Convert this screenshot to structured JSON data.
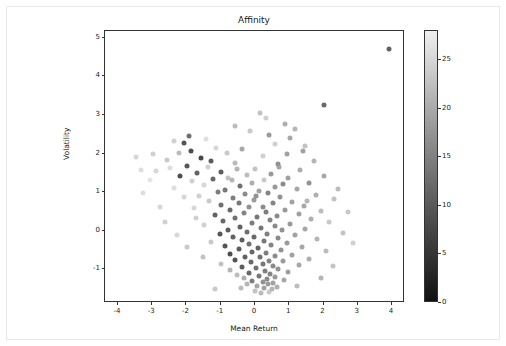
{
  "chart_data": {
    "type": "scatter",
    "title": "Affinity",
    "xlabel": "Mean Return",
    "ylabel": "Volatility",
    "xlim": [
      -4.35,
      4.35
    ],
    "ylim": [
      -1.85,
      5.15
    ],
    "xticks": [
      -4,
      -3,
      -2,
      -1,
      0,
      1,
      2,
      3,
      4
    ],
    "yticks": [
      -1,
      0,
      1,
      2,
      3,
      4,
      5
    ],
    "xtick_labels": [
      "-4",
      "-3",
      "-2",
      "-1",
      "0",
      "1",
      "2",
      "3",
      "4"
    ],
    "ytick_labels": [
      "-1",
      "0",
      "1",
      "2",
      "3",
      "4",
      "5"
    ],
    "grid": false,
    "legend": "none",
    "colorbar": {
      "label": "",
      "vmin": 0,
      "vmax": 28,
      "ticks": [
        0,
        5,
        10,
        15,
        20,
        25
      ],
      "tick_labels": [
        "0",
        "5",
        "10",
        "15",
        "20",
        "25"
      ],
      "colormap": "greys-reversed",
      "position": "right"
    },
    "marker": {
      "shape": "circle",
      "size": 5,
      "alpha": 0.85
    },
    "points": [
      {
        "x": 3.95,
        "y": 4.68,
        "c": 22
      },
      {
        "x": 2.05,
        "y": 3.22,
        "c": 21
      },
      {
        "x": 0.18,
        "y": 3.02,
        "c": 8
      },
      {
        "x": 1.2,
        "y": 2.62,
        "c": 10
      },
      {
        "x": -0.12,
        "y": 2.55,
        "c": 7
      },
      {
        "x": 0.45,
        "y": 2.45,
        "c": 14
      },
      {
        "x": 1.05,
        "y": 2.38,
        "c": 12
      },
      {
        "x": -2.35,
        "y": 2.3,
        "c": 6
      },
      {
        "x": -2.05,
        "y": 2.25,
        "c": 24
      },
      {
        "x": 0.6,
        "y": 2.22,
        "c": 6
      },
      {
        "x": 1.5,
        "y": 2.18,
        "c": 8
      },
      {
        "x": -1.1,
        "y": 2.12,
        "c": 5
      },
      {
        "x": -0.35,
        "y": 2.1,
        "c": 12
      },
      {
        "x": -1.85,
        "y": 2.05,
        "c": 25
      },
      {
        "x": -2.2,
        "y": 2.0,
        "c": 9
      },
      {
        "x": -0.8,
        "y": 1.98,
        "c": 7
      },
      {
        "x": 0.95,
        "y": 1.95,
        "c": 13
      },
      {
        "x": 0.25,
        "y": 1.9,
        "c": 6
      },
      {
        "x": -3.45,
        "y": 1.88,
        "c": 5
      },
      {
        "x": -1.55,
        "y": 1.85,
        "c": 26
      },
      {
        "x": -2.55,
        "y": 1.8,
        "c": 7
      },
      {
        "x": 1.75,
        "y": 1.78,
        "c": 10
      },
      {
        "x": -0.55,
        "y": 1.72,
        "c": 9
      },
      {
        "x": 0.7,
        "y": 1.7,
        "c": 15
      },
      {
        "x": -1.95,
        "y": 1.66,
        "c": 24
      },
      {
        "x": -1.35,
        "y": 1.62,
        "c": 6
      },
      {
        "x": -2.45,
        "y": 1.6,
        "c": 4
      },
      {
        "x": 0.02,
        "y": 1.58,
        "c": 8
      },
      {
        "x": 1.35,
        "y": 1.55,
        "c": 11
      },
      {
        "x": -2.85,
        "y": 1.52,
        "c": 5
      },
      {
        "x": -0.95,
        "y": 1.5,
        "c": 23
      },
      {
        "x": -1.65,
        "y": 1.48,
        "c": 22
      },
      {
        "x": 0.5,
        "y": 1.45,
        "c": 14
      },
      {
        "x": -0.2,
        "y": 1.42,
        "c": 9
      },
      {
        "x": 2.05,
        "y": 1.4,
        "c": 12
      },
      {
        "x": -2.15,
        "y": 1.38,
        "c": 25
      },
      {
        "x": 1.0,
        "y": 1.35,
        "c": 13
      },
      {
        "x": -1.2,
        "y": 1.32,
        "c": 21
      },
      {
        "x": 0.3,
        "y": 1.3,
        "c": 7
      },
      {
        "x": -0.65,
        "y": 1.28,
        "c": 10
      },
      {
        "x": -1.8,
        "y": 1.25,
        "c": 6
      },
      {
        "x": 1.6,
        "y": 1.22,
        "c": 15
      },
      {
        "x": -0.05,
        "y": 1.2,
        "c": 11
      },
      {
        "x": 0.85,
        "y": 1.18,
        "c": 16
      },
      {
        "x": -1.45,
        "y": 1.15,
        "c": 5
      },
      {
        "x": -0.4,
        "y": 1.12,
        "c": 20
      },
      {
        "x": 0.62,
        "y": 1.1,
        "c": 14
      },
      {
        "x": -2.35,
        "y": 1.08,
        "c": 4
      },
      {
        "x": 1.25,
        "y": 1.05,
        "c": 12
      },
      {
        "x": -0.85,
        "y": 1.02,
        "c": 19
      },
      {
        "x": 0.15,
        "y": 1.0,
        "c": 13
      },
      {
        "x": -1.05,
        "y": 0.98,
        "c": 18
      },
      {
        "x": 0.42,
        "y": 0.95,
        "c": 17
      },
      {
        "x": -0.25,
        "y": 0.92,
        "c": 16
      },
      {
        "x": 1.8,
        "y": 0.9,
        "c": 11
      },
      {
        "x": -1.6,
        "y": 0.88,
        "c": 6
      },
      {
        "x": 0.75,
        "y": 0.85,
        "c": 15
      },
      {
        "x": -0.6,
        "y": 0.82,
        "c": 18
      },
      {
        "x": 2.35,
        "y": 0.8,
        "c": 8
      },
      {
        "x": 0.0,
        "y": 0.78,
        "c": 14
      },
      {
        "x": -1.3,
        "y": 0.75,
        "c": 7
      },
      {
        "x": 1.1,
        "y": 0.72,
        "c": 13
      },
      {
        "x": -0.45,
        "y": 0.7,
        "c": 19
      },
      {
        "x": 0.55,
        "y": 0.68,
        "c": 17
      },
      {
        "x": -0.95,
        "y": 0.65,
        "c": 20
      },
      {
        "x": 1.45,
        "y": 0.62,
        "c": 12
      },
      {
        "x": 0.25,
        "y": 0.6,
        "c": 16
      },
      {
        "x": -0.15,
        "y": 0.58,
        "c": 15
      },
      {
        "x": -1.75,
        "y": 0.55,
        "c": 5
      },
      {
        "x": 0.9,
        "y": 0.52,
        "c": 14
      },
      {
        "x": -0.7,
        "y": 0.5,
        "c": 21
      },
      {
        "x": 1.95,
        "y": 0.48,
        "c": 9
      },
      {
        "x": 0.35,
        "y": 0.45,
        "c": 18
      },
      {
        "x": -0.3,
        "y": 0.42,
        "c": 17
      },
      {
        "x": 1.3,
        "y": 0.4,
        "c": 13
      },
      {
        "x": -1.15,
        "y": 0.38,
        "c": 22
      },
      {
        "x": 0.68,
        "y": 0.35,
        "c": 16
      },
      {
        "x": 0.08,
        "y": 0.32,
        "c": 19
      },
      {
        "x": -0.55,
        "y": 0.3,
        "c": 20
      },
      {
        "x": 1.65,
        "y": 0.28,
        "c": 11
      },
      {
        "x": 0.48,
        "y": 0.25,
        "c": 17
      },
      {
        "x": -0.9,
        "y": 0.22,
        "c": 21
      },
      {
        "x": 2.2,
        "y": 0.2,
        "c": 7
      },
      {
        "x": -0.05,
        "y": 0.18,
        "c": 18
      },
      {
        "x": 1.05,
        "y": 0.15,
        "c": 14
      },
      {
        "x": -1.45,
        "y": 0.12,
        "c": 6
      },
      {
        "x": 0.6,
        "y": 0.1,
        "c": 16
      },
      {
        "x": -0.4,
        "y": 0.08,
        "c": 22
      },
      {
        "x": 0.2,
        "y": 0.05,
        "c": 19
      },
      {
        "x": 1.5,
        "y": 0.02,
        "c": 12
      },
      {
        "x": -0.75,
        "y": 0.0,
        "c": 23
      },
      {
        "x": 0.82,
        "y": -0.02,
        "c": 15
      },
      {
        "x": -0.2,
        "y": -0.05,
        "c": 20
      },
      {
        "x": 2.6,
        "y": -0.08,
        "c": 8
      },
      {
        "x": 0.38,
        "y": -0.1,
        "c": 18
      },
      {
        "x": -1.0,
        "y": -0.12,
        "c": 24
      },
      {
        "x": 1.2,
        "y": -0.15,
        "c": 13
      },
      {
        "x": 0.0,
        "y": -0.18,
        "c": 21
      },
      {
        "x": -0.6,
        "y": -0.2,
        "c": 22
      },
      {
        "x": 0.7,
        "y": -0.22,
        "c": 16
      },
      {
        "x": 1.85,
        "y": -0.25,
        "c": 10
      },
      {
        "x": -0.35,
        "y": -0.28,
        "c": 23
      },
      {
        "x": 0.28,
        "y": -0.3,
        "c": 19
      },
      {
        "x": -1.25,
        "y": -0.32,
        "c": 7
      },
      {
        "x": 0.95,
        "y": -0.35,
        "c": 14
      },
      {
        "x": -0.15,
        "y": -0.38,
        "c": 20
      },
      {
        "x": 0.5,
        "y": -0.4,
        "c": 17
      },
      {
        "x": -0.85,
        "y": -0.42,
        "c": 24
      },
      {
        "x": 1.4,
        "y": -0.45,
        "c": 12
      },
      {
        "x": 0.12,
        "y": -0.48,
        "c": 22
      },
      {
        "x": -0.45,
        "y": -0.5,
        "c": 23
      },
      {
        "x": 0.78,
        "y": -0.52,
        "c": 15
      },
      {
        "x": 2.1,
        "y": -0.55,
        "c": 9
      },
      {
        "x": -0.05,
        "y": -0.58,
        "c": 21
      },
      {
        "x": 0.35,
        "y": -0.6,
        "c": 18
      },
      {
        "x": -0.7,
        "y": -0.62,
        "c": 25
      },
      {
        "x": 1.1,
        "y": -0.65,
        "c": 13
      },
      {
        "x": 0.6,
        "y": -0.68,
        "c": 16
      },
      {
        "x": -0.25,
        "y": -0.7,
        "c": 22
      },
      {
        "x": 0.18,
        "y": -0.72,
        "c": 20
      },
      {
        "x": 1.6,
        "y": -0.75,
        "c": 11
      },
      {
        "x": -0.55,
        "y": -0.78,
        "c": 24
      },
      {
        "x": 0.45,
        "y": -0.8,
        "c": 17
      },
      {
        "x": 0.85,
        "y": -0.82,
        "c": 14
      },
      {
        "x": -0.1,
        "y": -0.85,
        "c": 21
      },
      {
        "x": 0.25,
        "y": -0.88,
        "c": 19
      },
      {
        "x": -0.95,
        "y": -0.9,
        "c": 8
      },
      {
        "x": 1.3,
        "y": -0.92,
        "c": 12
      },
      {
        "x": 0.55,
        "y": -0.95,
        "c": 16
      },
      {
        "x": -0.35,
        "y": -0.98,
        "c": 23
      },
      {
        "x": 0.05,
        "y": -1.0,
        "c": 20
      },
      {
        "x": 0.7,
        "y": -1.02,
        "c": 15
      },
      {
        "x": -0.7,
        "y": -1.05,
        "c": 10
      },
      {
        "x": 0.32,
        "y": -1.08,
        "c": 18
      },
      {
        "x": 1.0,
        "y": -1.1,
        "c": 13
      },
      {
        "x": -0.15,
        "y": -1.12,
        "c": 21
      },
      {
        "x": 0.48,
        "y": -1.15,
        "c": 17
      },
      {
        "x": -0.5,
        "y": -1.18,
        "c": 9
      },
      {
        "x": 0.15,
        "y": -1.2,
        "c": 19
      },
      {
        "x": 0.62,
        "y": -1.22,
        "c": 14
      },
      {
        "x": -0.3,
        "y": -1.25,
        "c": 11
      },
      {
        "x": 0.38,
        "y": -1.28,
        "c": 16
      },
      {
        "x": 0.88,
        "y": -1.3,
        "c": 12
      },
      {
        "x": -0.05,
        "y": -1.32,
        "c": 18
      },
      {
        "x": 0.25,
        "y": -1.35,
        "c": 15
      },
      {
        "x": 0.55,
        "y": -1.38,
        "c": 13
      },
      {
        "x": -0.2,
        "y": -1.4,
        "c": 10
      },
      {
        "x": 0.42,
        "y": -1.42,
        "c": 14
      },
      {
        "x": 0.1,
        "y": -1.45,
        "c": 12
      },
      {
        "x": 0.68,
        "y": -1.48,
        "c": 11
      },
      {
        "x": -0.38,
        "y": -1.5,
        "c": 9
      },
      {
        "x": 0.3,
        "y": -1.52,
        "c": 13
      },
      {
        "x": 0.52,
        "y": -1.55,
        "c": 10
      },
      {
        "x": 0.02,
        "y": -1.58,
        "c": 8
      },
      {
        "x": 0.45,
        "y": -1.62,
        "c": 7
      },
      {
        "x": 0.2,
        "y": -1.65,
        "c": 9
      },
      {
        "x": -1.9,
        "y": 2.42,
        "c": 20
      },
      {
        "x": -1.4,
        "y": 2.35,
        "c": 4
      },
      {
        "x": -3.05,
        "y": 1.3,
        "c": 3
      },
      {
        "x": -3.25,
        "y": 0.95,
        "c": 4
      },
      {
        "x": -2.75,
        "y": 0.6,
        "c": 5
      },
      {
        "x": -2.6,
        "y": 0.2,
        "c": 6
      },
      {
        "x": -2.25,
        "y": -0.15,
        "c": 5
      },
      {
        "x": -1.95,
        "y": -0.45,
        "c": 7
      },
      {
        "x": -1.7,
        "y": 0.3,
        "c": 6
      },
      {
        "x": -1.5,
        "y": -0.7,
        "c": 8
      },
      {
        "x": 2.45,
        "y": 1.05,
        "c": 9
      },
      {
        "x": 2.75,
        "y": 0.45,
        "c": 7
      },
      {
        "x": 2.9,
        "y": -0.35,
        "c": 6
      },
      {
        "x": 2.3,
        "y": -0.95,
        "c": 8
      },
      {
        "x": 1.95,
        "y": -1.25,
        "c": 10
      },
      {
        "x": -1.15,
        "y": -1.55,
        "c": 7
      },
      {
        "x": 1.25,
        "y": -1.45,
        "c": 9
      },
      {
        "x": 0.9,
        "y": 2.75,
        "c": 11
      },
      {
        "x": -0.55,
        "y": 2.68,
        "c": 9
      },
      {
        "x": 0.35,
        "y": 2.9,
        "c": 6
      },
      {
        "x": 1.42,
        "y": 2.05,
        "c": 13
      },
      {
        "x": -2.95,
        "y": 1.95,
        "c": 6
      },
      {
        "x": -3.3,
        "y": 1.55,
        "c": 4
      },
      {
        "x": 0.72,
        "y": 1.62,
        "c": 12
      },
      {
        "x": -1.25,
        "y": 1.78,
        "c": 23
      },
      {
        "x": -0.75,
        "y": 1.35,
        "c": 8
      },
      {
        "x": 1.55,
        "y": 0.75,
        "c": 10
      },
      {
        "x": -2.05,
        "y": 0.85,
        "c": 5
      },
      {
        "x": 0.05,
        "y": 0.88,
        "c": 15
      },
      {
        "x": -0.5,
        "y": 1.58,
        "c": 10
      }
    ]
  }
}
